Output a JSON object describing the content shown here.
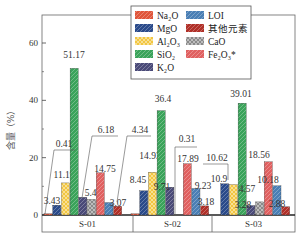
{
  "chart_data": {
    "type": "bar",
    "title": "",
    "xlabel": "",
    "ylabel": "含量（%）",
    "ylim": [
      0,
      70
    ],
    "yticks": [
      0,
      20,
      40,
      60
    ],
    "categories": [
      "S-01",
      "S-02",
      "S-03"
    ],
    "legend_position": "upper right",
    "series": [
      {
        "name": "Na2O",
        "label": "Na₂O",
        "color": "#e0553a",
        "pattern": "hatch",
        "values": [
          0.41,
          0.31,
          0
        ]
      },
      {
        "name": "MgO",
        "label": "MgO",
        "color": "#2a4a8a",
        "pattern": "hatch",
        "values": [
          3.43,
          8.45,
          10.9
        ]
      },
      {
        "name": "Al2O3",
        "label": "Al₂O₃",
        "color": "#f2c640",
        "pattern": "cross",
        "values": [
          11.19,
          14.93,
          10.62
        ]
      },
      {
        "name": "SiO2",
        "label": "SiO₂",
        "color": "#3aa35a",
        "pattern": "hatch",
        "values": [
          51.17,
          36.4,
          39.01
        ]
      },
      {
        "name": "K2O",
        "label": "K₂O",
        "color": "#4a4a78",
        "pattern": "hatch",
        "values": [
          6.18,
          9.71,
          3.28
        ]
      },
      {
        "name": "CaO",
        "label": "CaO",
        "color": "#8a8a8a",
        "pattern": "cross",
        "values": [
          5.46,
          0,
          4.57
        ]
      },
      {
        "name": "Fe2O3*",
        "label": "Fe₂O₃*",
        "color": "#e06060",
        "pattern": "hatch",
        "values": [
          14.75,
          17.89,
          18.56
        ]
      },
      {
        "name": "LOI",
        "label": "LOI",
        "color": "#4a7fb5",
        "pattern": "hatch",
        "values": [
          4.34,
          9.23,
          10.18
        ]
      },
      {
        "name": "其他元素",
        "label": "其他元素",
        "color": "#b03028",
        "pattern": "hatch",
        "values": [
          3.07,
          3.18,
          2.88
        ]
      }
    ],
    "data_labels": {
      "S-01": [
        "0.41",
        "3.43",
        "11.19",
        "51.17",
        "6.18",
        "5.46",
        "14.75",
        "4.34",
        "3.07"
      ],
      "S-02": [
        "0.31",
        "8.45",
        "14.93",
        "36.4",
        "9.71",
        "",
        "17.89",
        "9.23",
        "3.18"
      ],
      "S-03": [
        "",
        "10.9",
        "10.62",
        "39.01",
        "3.28",
        "4.57",
        "18.56",
        "10.18",
        "2.88"
      ]
    }
  }
}
